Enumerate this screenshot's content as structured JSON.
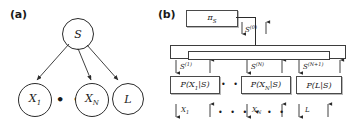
{
  "figure": {
    "panel_a": {
      "label": "(a)",
      "type": "bayesian-network",
      "root_node": "S",
      "leaf_nodes": [
        "X",
        "X",
        "L"
      ],
      "leaf_labels": [
        {
          "base": "X",
          "sub": "1"
        },
        {
          "base": "X",
          "sub": "N"
        },
        {
          "base": "L",
          "sub": ""
        }
      ],
      "ellipsis": "• • •",
      "edges": [
        {
          "from": "S",
          "to": "X_1"
        },
        {
          "from": "S",
          "to": "X_N"
        },
        {
          "from": "S",
          "to": "L"
        }
      ]
    },
    "panel_b": {
      "label": "(b)",
      "type": "message-passing-factor-graph",
      "prior_box": {
        "base": "π",
        "sub": "S"
      },
      "prior_message": {
        "base": "S",
        "sup": "(0)"
      },
      "bus_messages": [
        {
          "base": "S",
          "sup": "(1)"
        },
        {
          "base": "S",
          "sup": "(N)"
        },
        {
          "base": "S",
          "sup": "(N+1)"
        }
      ],
      "factor_boxes": [
        {
          "text": "P(X",
          "sub": "1",
          "tail": "|S)"
        },
        {
          "text": "P(X",
          "sub": "N",
          "tail": "|S)"
        },
        {
          "text": "P(L|S)",
          "sub": "",
          "tail": ""
        }
      ],
      "observation_labels": [
        {
          "base": "X",
          "sub": "1"
        },
        {
          "base": "X",
          "sub": "N"
        },
        {
          "base": "L",
          "sub": ""
        }
      ],
      "ellipsis_factors": "• • • • •",
      "ellipsis_observations": "• • • • • •"
    }
  },
  "colors": {
    "stroke": "#2b2b2b",
    "box_stroke": "#4a4a4a",
    "box_shadow": "#b8b8b8",
    "background": "#ffffff"
  }
}
